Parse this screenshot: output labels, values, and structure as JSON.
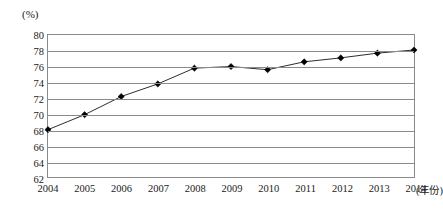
{
  "chart_data": {
    "type": "line",
    "title": "",
    "subtitle": "",
    "xlabel": "(年份)",
    "ylabel": "(%)",
    "categories": [
      "2004",
      "2005",
      "2006",
      "2007",
      "2008",
      "2009",
      "2010",
      "2011",
      "2012",
      "2013",
      "2014"
    ],
    "x": [
      2004,
      2005,
      2006,
      2007,
      2008,
      2009,
      2010,
      2011,
      2012,
      2013,
      2014
    ],
    "values": [
      68.0,
      69.9,
      72.2,
      73.8,
      75.8,
      76.0,
      75.6,
      76.6,
      77.1,
      77.7,
      78.1
    ],
    "series": [
      {
        "name": "",
        "values": [
          68.0,
          69.9,
          72.2,
          73.8,
          75.8,
          76.0,
          75.6,
          76.6,
          77.1,
          77.7,
          78.1
        ]
      }
    ],
    "ylim": [
      62,
      80
    ],
    "xlim": [
      2004,
      2014
    ],
    "yticks": [
      62,
      64,
      66,
      68,
      70,
      72,
      74,
      76,
      78,
      80
    ],
    "ytick_labels": [
      "62",
      "64",
      "66",
      "68",
      "70",
      "72",
      "74",
      "76",
      "78",
      "80"
    ],
    "xtick_labels": [
      "2004",
      "2005",
      "2006",
      "2007",
      "2008",
      "2009",
      "2010",
      "2011",
      "2012",
      "2013",
      "2014"
    ],
    "grid": true,
    "grid_axis": "y",
    "legend": false,
    "legend_position": "none",
    "marker": "diamond",
    "line_color": "#2b2b2b",
    "marker_color": "#000000",
    "grid_color": "#8a8a8a",
    "background_color": "#ffffff",
    "annotations": []
  },
  "axes": {
    "y_unit_caption": "(%)",
    "x_unit_caption": "(年份)"
  }
}
